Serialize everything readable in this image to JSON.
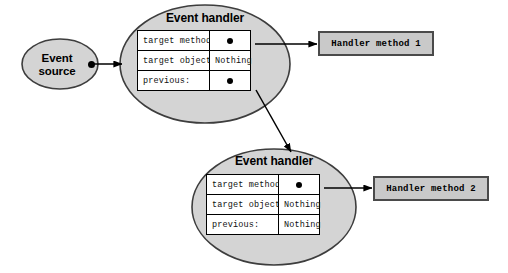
{
  "canvas": {
    "width": 508,
    "height": 273,
    "background": "#ffffff"
  },
  "palette": {
    "ellipse_fill": "#d4d4d4",
    "ellipse_stroke": "#3d3d3d",
    "box_fill": "#c9c9c9",
    "box_stroke": "#4a4a4a",
    "table_fill": "#ffffff",
    "table_stroke": "#000000",
    "arrow": "#000000",
    "text": "#000000"
  },
  "event_source": {
    "label_line1": "Event",
    "label_line2": "source",
    "shape": "ellipse",
    "pin_icon": "source-pin-dot"
  },
  "handlers": [
    {
      "id": "handler-1",
      "title": "Event handler",
      "rows": [
        {
          "key": "target method:",
          "value_type": "pin",
          "value": ""
        },
        {
          "key": "target object:",
          "value_type": "text",
          "value": "Nothing"
        },
        {
          "key": "previous:",
          "value_type": "pin",
          "value": ""
        }
      ]
    },
    {
      "id": "handler-2",
      "title": "Event handler",
      "rows": [
        {
          "key": "target method:",
          "value_type": "pin",
          "value": ""
        },
        {
          "key": "target object:",
          "value_type": "text",
          "value": "Nothing"
        },
        {
          "key": "previous:",
          "value_type": "text",
          "value": "Nothing"
        }
      ]
    }
  ],
  "method_boxes": [
    {
      "id": "handler-method-1",
      "label": "Handler method 1"
    },
    {
      "id": "handler-method-2",
      "label": "Handler method 2"
    }
  ],
  "connectors": [
    {
      "id": "source-to-handler-1",
      "from": "event-source-pin",
      "to": "handler-1-ellipse",
      "style": "straight-arrow"
    },
    {
      "id": "handler-1-method-to-box-1",
      "from": "handler-1-target-method-pin",
      "to": "handler-method-1",
      "style": "straight-arrow"
    },
    {
      "id": "handler-1-previous-to-handler-2",
      "from": "handler-1-previous-pin",
      "to": "handler-2-ellipse",
      "style": "diagonal-arrow"
    },
    {
      "id": "handler-2-method-to-box-2",
      "from": "handler-2-target-method-pin",
      "to": "handler-method-2",
      "style": "straight-arrow"
    }
  ]
}
